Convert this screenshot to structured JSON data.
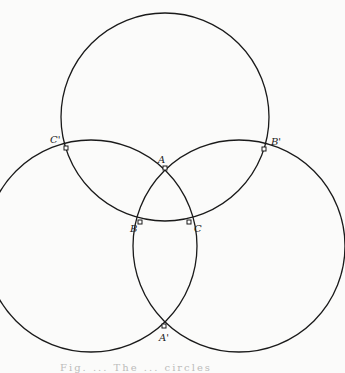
{
  "figure": {
    "circles": [
      {
        "name": "top-circle",
        "cx": 165,
        "cy": 117,
        "r": 104
      },
      {
        "name": "left-circle",
        "cx": 91,
        "cy": 246,
        "r": 106
      },
      {
        "name": "right-circle",
        "cx": 239,
        "cy": 246,
        "r": 106
      }
    ],
    "points": [
      {
        "label": "A",
        "x": 165,
        "y": 168,
        "lx": 158,
        "ly": 154
      },
      {
        "label": "B",
        "x": 140,
        "y": 222,
        "lx": 130,
        "ly": 223
      },
      {
        "label": "C",
        "x": 189,
        "y": 222,
        "lx": 194,
        "ly": 223
      },
      {
        "label": "C'",
        "x": 66,
        "y": 148,
        "lx": 50,
        "ly": 134
      },
      {
        "label": "B'",
        "x": 264,
        "y": 149,
        "lx": 271,
        "ly": 136
      },
      {
        "label": "A'",
        "x": 164,
        "y": 326,
        "lx": 159,
        "ly": 332
      }
    ],
    "caption": "Fig. ... The ... circles"
  }
}
